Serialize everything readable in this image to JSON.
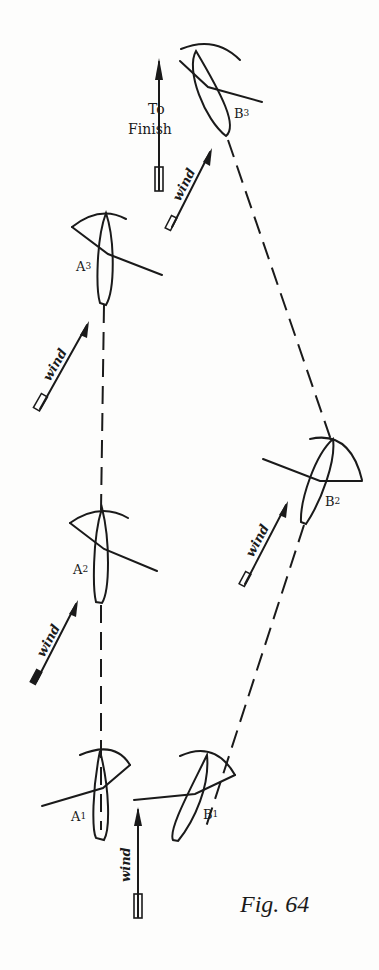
{
  "figure": {
    "caption": "Fig. 64",
    "finish_label_line1": "To",
    "finish_label_line2": "Finish",
    "wind_label": "wind",
    "ink_color": "#1a1a1a",
    "background_color": "#fdfdfc"
  },
  "boats": {
    "A1": {
      "label": "A1",
      "label_main": "A",
      "label_sub": "1"
    },
    "A2": {
      "label": "A2",
      "label_main": "A",
      "label_sub": "2"
    },
    "A3": {
      "label": "A3",
      "label_main": "A",
      "label_sub": "3"
    },
    "B1": {
      "label": "B1",
      "label_main": "B",
      "label_sub": "1"
    },
    "B2": {
      "label": "B2",
      "label_main": "B",
      "label_sub": "2"
    },
    "B3": {
      "label": "B3",
      "label_main": "B",
      "label_sub": "3"
    }
  },
  "wind_arrows": [
    {
      "id": "wind-A3",
      "label": "wind"
    },
    {
      "id": "wind-A2",
      "label": "wind"
    },
    {
      "id": "wind-B3",
      "label": "wind"
    },
    {
      "id": "wind-B2",
      "label": "wind"
    },
    {
      "id": "wind-bottom",
      "label": "wind"
    }
  ]
}
